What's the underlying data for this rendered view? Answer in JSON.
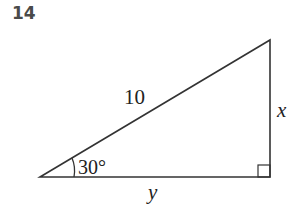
{
  "problem": {
    "number": "14"
  },
  "diagram": {
    "type": "right-triangle",
    "hypotenuse_label": "10",
    "angle_label": "30°",
    "opposite_label": "x",
    "adjacent_label": "y",
    "right_angle_marker": true,
    "stroke_color": "#333333"
  }
}
